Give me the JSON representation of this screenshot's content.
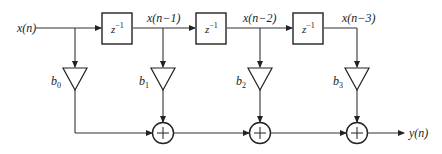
{
  "diagram": {
    "input_label": "x(n)",
    "output_label": "y(n)",
    "delay_label": "z",
    "delay_exponent": "−1",
    "delays": [
      {
        "label": "z⁻¹"
      },
      {
        "label": "z⁻¹"
      },
      {
        "label": "z⁻¹"
      }
    ],
    "taps": [
      {
        "signal": "",
        "coef_base": "b",
        "coef_sub": "0"
      },
      {
        "signal": "x(n−1)",
        "coef_base": "b",
        "coef_sub": "1"
      },
      {
        "signal": "x(n−2)",
        "coef_base": "b",
        "coef_sub": "2"
      },
      {
        "signal": "x(n−3)",
        "coef_base": "b",
        "coef_sub": "3"
      }
    ],
    "adders": [
      {
        "symbol": "+"
      },
      {
        "symbol": "+"
      },
      {
        "symbol": "+"
      }
    ],
    "colors": {
      "line": "#333333",
      "background": "#ffffff"
    }
  }
}
